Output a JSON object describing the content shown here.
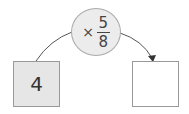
{
  "input_box": {
    "value": "4"
  },
  "operator": {
    "symbol": "×",
    "numerator": "5",
    "denominator": "8"
  },
  "output_box": {
    "value": ""
  },
  "colors": {
    "input_fill": "#e6e6e6",
    "operator_fill": "#ececec",
    "stroke": "#999999"
  }
}
